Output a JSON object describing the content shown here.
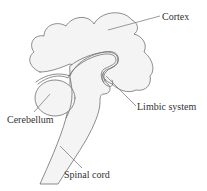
{
  "figure": {
    "labels": {
      "cortex": "Cortex",
      "limbic_system": "Limbic system",
      "cerebellum": "Cerebellum",
      "spinal_cord": "Spinal cord"
    },
    "colors": {
      "fill": "#f4f4f4",
      "stroke": "#707070",
      "text": "#333333",
      "background": "#ffffff"
    }
  }
}
